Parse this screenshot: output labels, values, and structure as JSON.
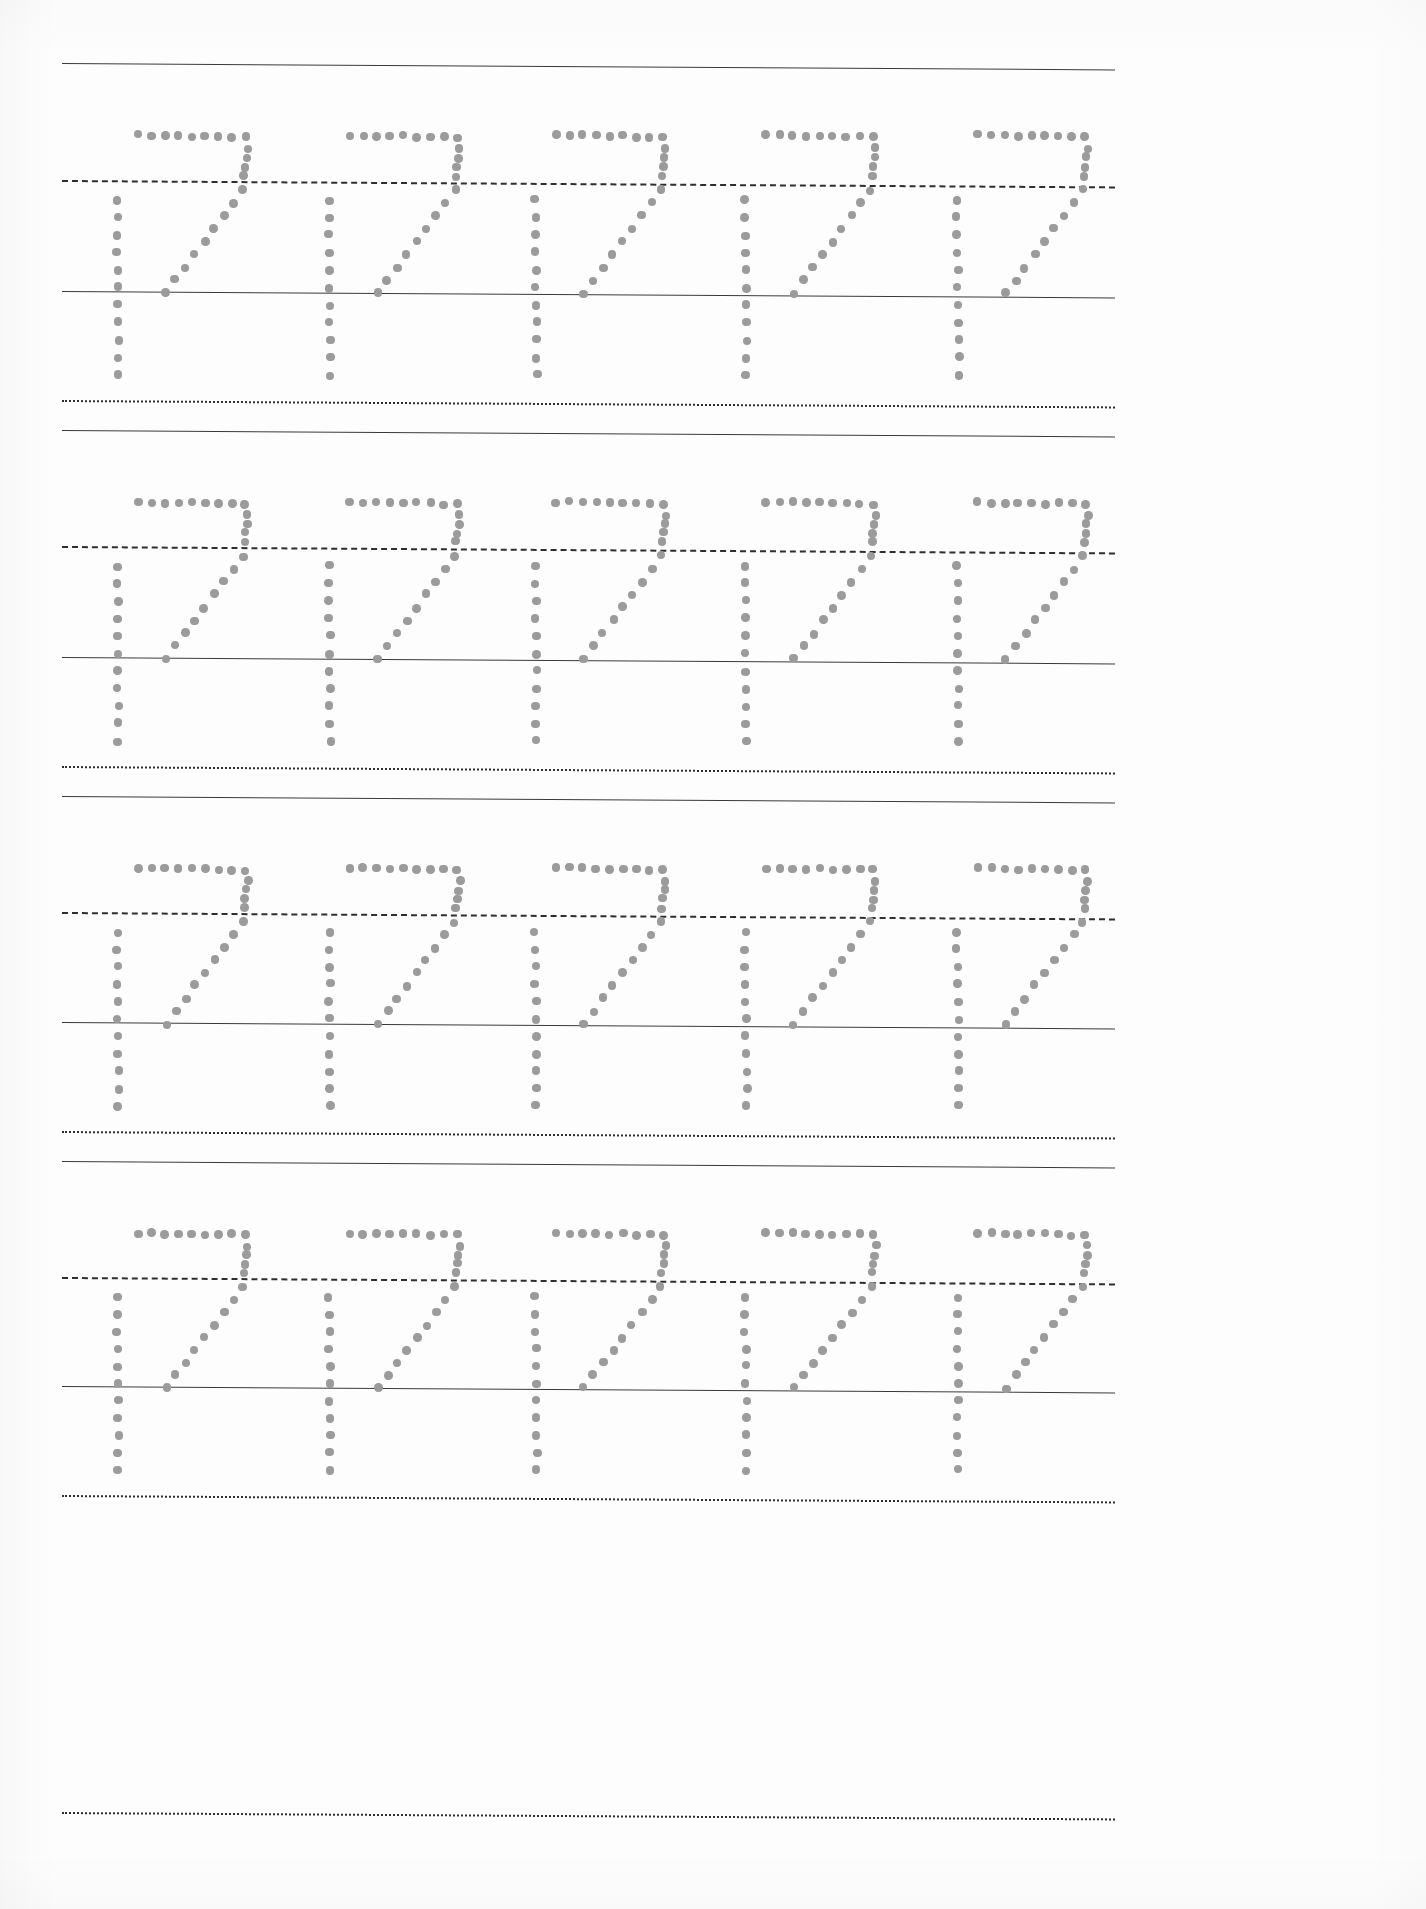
{
  "worksheet": {
    "kind": "handwriting-tracing-worksheet",
    "title": "",
    "page_width": 1426,
    "page_height": 1909,
    "background_color": "#fdfdfd",
    "dot_color": "#9b9b9b",
    "line_color": "#3a3a3a",
    "traced_characters": "17",
    "rows_count": 4,
    "groups_per_row": 5,
    "total_groups": 20,
    "rows": [
      {
        "index": 1,
        "top_line_y": 63,
        "mid_line_y": 180,
        "base_line_y": 291,
        "descender_line_y": 400,
        "row_bottom_guide_y": 430
      },
      {
        "index": 2,
        "top_line_y": 430,
        "mid_line_y": 546,
        "base_line_y": 657,
        "descender_line_y": 766,
        "row_bottom_guide_y": 796
      },
      {
        "index": 3,
        "top_line_y": 796,
        "mid_line_y": 912,
        "base_line_y": 1022,
        "descender_line_y": 1131,
        "row_bottom_guide_y": 1161
      },
      {
        "index": 4,
        "top_line_y": 1161,
        "mid_line_y": 1277,
        "base_line_y": 1386,
        "descender_line_y": 1495,
        "row_bottom_guide_y": 1525
      }
    ],
    "group_origins_x": [
      95,
      307,
      513,
      723,
      935
    ],
    "group_advance_x": 210,
    "line_left_x": 62,
    "line_right_x": 1115,
    "line_tilt_deg": 0.35,
    "glyph_spec": {
      "one": {
        "name": "digit-one-vertical-stroke",
        "stem_x_offset": 22,
        "start_y_offset_from_mid": 20,
        "end_y_offset_from_base": 84,
        "dot_count": 11
      },
      "seven": {
        "name": "digit-seven-stroke",
        "top_bar_y_offset_from_top": 72,
        "top_bar_x_start_offset": 43,
        "top_bar_x_end_offset": 150,
        "top_bar_dot_count": 9,
        "shoulder_dot_count": 4,
        "diagonal_dot_count": 9,
        "diagonal_end_x_offset": 71
      }
    }
  }
}
